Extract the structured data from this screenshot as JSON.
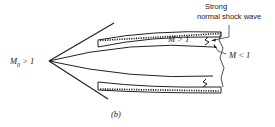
{
  "labels": {
    "freestream": "M₀ > 1",
    "freestream_sym": "M",
    "freestream_sub": "0",
    "freestream_rel": "> 1",
    "strong_line1": "Strong",
    "strong_line2": "normal shock wave",
    "supersonic": "M > 1",
    "subsonic": "M < 1",
    "caption": "(b)"
  },
  "colors": {
    "ink": "#222222",
    "background": "#ffffff"
  }
}
